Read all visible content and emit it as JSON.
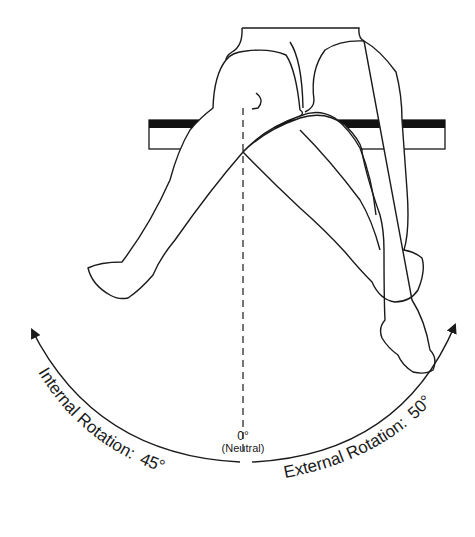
{
  "diagram": {
    "neutral": {
      "degree": "0°",
      "label": "(Neutral)"
    },
    "internal": {
      "label": "Internal Rotation:",
      "value": "45°"
    },
    "external": {
      "label": "External Rotation:",
      "value": "50°"
    },
    "colors": {
      "line": "#1a1a1a",
      "background": "#ffffff"
    }
  }
}
